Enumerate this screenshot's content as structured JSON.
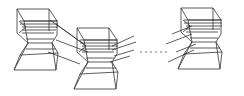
{
  "diagram": {
    "blocks": [
      {
        "id": "block-1",
        "x": 14,
        "y": 9
      },
      {
        "id": "block-2",
        "x": 73,
        "y": 28
      },
      {
        "id": "block-3",
        "x": 175,
        "y": 8
      }
    ],
    "ellipsis": {
      "dots": 6,
      "y": 52,
      "x_start": 141,
      "x_end": 166
    },
    "colors": {
      "stroke": "#333333",
      "background": "#ffffff"
    }
  }
}
